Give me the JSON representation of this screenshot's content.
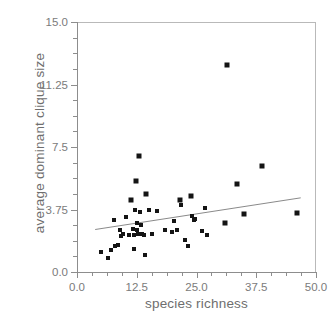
{
  "chart_data": {
    "type": "scatter",
    "title": "",
    "xlabel": "species richness",
    "ylabel": "average dominant clique size",
    "xlim": [
      0.0,
      50.0
    ],
    "ylim": [
      0.0,
      15.0
    ],
    "xticks": [
      0.0,
      12.5,
      25.0,
      37.5,
      50.0
    ],
    "xticklabels": [
      "0.0",
      "12.5",
      "25.0",
      "37.5",
      "50.0"
    ],
    "yticks": [
      0.0,
      3.75,
      7.5,
      11.25,
      15.0
    ],
    "yticklabels": [
      "0.0",
      "3.75",
      "7.5",
      "11.25",
      "15.0"
    ],
    "minor_ticks_per_interval": 3,
    "grid": false,
    "legend": null,
    "marker": "square",
    "marker_color": "#141414",
    "points": [
      {
        "x": 5.0,
        "y": 1.2
      },
      {
        "x": 6.5,
        "y": 0.85
      },
      {
        "x": 7.2,
        "y": 1.3
      },
      {
        "x": 8.0,
        "y": 1.55
      },
      {
        "x": 8.6,
        "y": 1.6
      },
      {
        "x": 7.8,
        "y": 3.15
      },
      {
        "x": 9.0,
        "y": 2.55
      },
      {
        "x": 9.3,
        "y": 2.15
      },
      {
        "x": 9.6,
        "y": 2.3
      },
      {
        "x": 10.2,
        "y": 3.3
      },
      {
        "x": 10.8,
        "y": 2.2
      },
      {
        "x": 11.4,
        "y": 4.35
      },
      {
        "x": 11.8,
        "y": 2.6
      },
      {
        "x": 11.9,
        "y": 2.25
      },
      {
        "x": 12.0,
        "y": 1.4
      },
      {
        "x": 12.2,
        "y": 3.7
      },
      {
        "x": 12.4,
        "y": 5.45
      },
      {
        "x": 12.5,
        "y": 2.95
      },
      {
        "x": 12.6,
        "y": 2.55
      },
      {
        "x": 12.8,
        "y": 2.3
      },
      {
        "x": 13.0,
        "y": 6.95
      },
      {
        "x": 13.2,
        "y": 3.6
      },
      {
        "x": 13.4,
        "y": 2.85
      },
      {
        "x": 13.6,
        "y": 2.3
      },
      {
        "x": 14.0,
        "y": 2.25
      },
      {
        "x": 14.2,
        "y": 1.05
      },
      {
        "x": 14.5,
        "y": 4.7
      },
      {
        "x": 15.0,
        "y": 3.7
      },
      {
        "x": 15.6,
        "y": 2.3
      },
      {
        "x": 16.8,
        "y": 3.65
      },
      {
        "x": 18.5,
        "y": 2.5
      },
      {
        "x": 19.8,
        "y": 2.4
      },
      {
        "x": 20.2,
        "y": 3.05
      },
      {
        "x": 21.0,
        "y": 2.55
      },
      {
        "x": 21.6,
        "y": 4.35
      },
      {
        "x": 21.8,
        "y": 4.05
      },
      {
        "x": 22.6,
        "y": 1.9
      },
      {
        "x": 23.2,
        "y": 1.55
      },
      {
        "x": 23.8,
        "y": 4.55
      },
      {
        "x": 24.0,
        "y": 3.35
      },
      {
        "x": 24.4,
        "y": 3.15
      },
      {
        "x": 24.6,
        "y": 3.2
      },
      {
        "x": 26.2,
        "y": 2.45
      },
      {
        "x": 26.8,
        "y": 3.85
      },
      {
        "x": 27.2,
        "y": 2.2
      },
      {
        "x": 31.0,
        "y": 2.95
      },
      {
        "x": 31.4,
        "y": 12.4
      },
      {
        "x": 33.4,
        "y": 5.3
      },
      {
        "x": 35.0,
        "y": 3.5
      },
      {
        "x": 38.6,
        "y": 6.35
      },
      {
        "x": 46.0,
        "y": 3.55
      }
    ],
    "trendline": {
      "visible": true,
      "color": "#8a8a8a",
      "x_start": 3.8,
      "y_start": 2.55,
      "x_end": 46.8,
      "y_end": 4.45
    }
  },
  "caption": ""
}
